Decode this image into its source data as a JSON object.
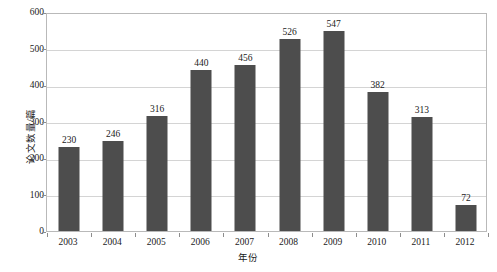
{
  "chart_data": {
    "type": "bar",
    "title": "",
    "xlabel": "年份",
    "ylabel": "论文数量/篇",
    "categories": [
      "2003",
      "2004",
      "2005",
      "2006",
      "2007",
      "2008",
      "2009",
      "2010",
      "2011",
      "2012"
    ],
    "values": [
      230,
      246,
      316,
      440,
      456,
      526,
      547,
      382,
      313,
      72
    ],
    "series": [
      {
        "name": "论文数量",
        "values": [
          230,
          246,
          316,
          440,
          456,
          526,
          547,
          382,
          313,
          72
        ]
      }
    ],
    "ylim": [
      0,
      600
    ],
    "ytick_labels": [
      "0",
      "100",
      "200",
      "300",
      "400",
      "500",
      "600"
    ],
    "ytick_values": [
      0,
      100,
      200,
      300,
      400,
      500,
      600
    ],
    "grid": true,
    "grid_axis": "y",
    "legend": false,
    "legend_position": "none",
    "data_labels": true,
    "bar_color": "#4d4d4d",
    "gridline_color": "#d4d4d4",
    "plot_border_color": "#b9b9b9",
    "background_color": "#ffffff",
    "text_color": "#1a1a1a"
  }
}
